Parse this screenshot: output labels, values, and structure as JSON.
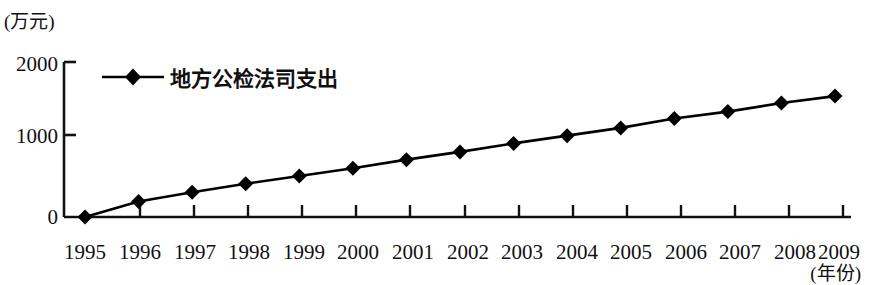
{
  "chart_data": {
    "type": "line",
    "title": "",
    "xlabel": "(年份)",
    "ylabel": "(万元)",
    "categories": [
      "1995",
      "1996",
      "1997",
      "1998",
      "1999",
      "2000",
      "2001",
      "2002",
      "2003",
      "2004",
      "2005",
      "2006",
      "2007",
      "2008",
      "2009"
    ],
    "values": [
      0,
      200,
      320,
      430,
      530,
      630,
      740,
      840,
      950,
      1050,
      1150,
      1270,
      1360,
      1470,
      1560
    ],
    "series": [
      {
        "name": "地方公检法司支出",
        "values": [
          0,
          200,
          320,
          430,
          530,
          630,
          740,
          840,
          950,
          1050,
          1150,
          1270,
          1360,
          1470,
          1560
        ]
      }
    ],
    "legend": [
      "地方公检法司支出"
    ],
    "legend_position": "top-left",
    "ylim": [
      0,
      2000
    ],
    "yticks": [
      0,
      1000,
      2000
    ],
    "ytick_labels": [
      "0",
      "1000",
      "2000"
    ],
    "grid": false,
    "marker": "diamond",
    "line_color": "#000000",
    "marker_color": "#000000"
  },
  "axes": {
    "y_unit": "(万元)",
    "x_unit": "(年份)",
    "y_ticks": [
      {
        "label": "2000",
        "value": 2000
      },
      {
        "label": "1000",
        "value": 1000
      },
      {
        "label": "0",
        "value": 0
      }
    ],
    "x_ticks": [
      {
        "label": "1995"
      },
      {
        "label": "1996"
      },
      {
        "label": "1997"
      },
      {
        "label": "1998"
      },
      {
        "label": "1999"
      },
      {
        "label": "2000"
      },
      {
        "label": "2001"
      },
      {
        "label": "2002"
      },
      {
        "label": "2003"
      },
      {
        "label": "2004"
      },
      {
        "label": "2005"
      },
      {
        "label": "2006"
      },
      {
        "label": "2007"
      },
      {
        "label": "2008"
      },
      {
        "label": "2009"
      }
    ]
  },
  "legend": {
    "label": "地方公检法司支出",
    "marker_icon": "diamond-marker-icon"
  }
}
